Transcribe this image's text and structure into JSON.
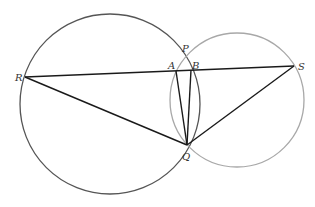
{
  "diagram": {
    "points": {
      "R": {
        "label": "R"
      },
      "P": {
        "label": "P"
      },
      "A": {
        "label": "A"
      },
      "B": {
        "label": "B"
      },
      "S": {
        "label": "S"
      },
      "Q": {
        "label": "Q"
      }
    },
    "circles": [
      {
        "name": "large-circle",
        "passes_through": [
          "R",
          "P",
          "B",
          "Q"
        ],
        "color": "#555555"
      },
      {
        "name": "small-circle",
        "passes_through": [
          "P",
          "A",
          "S",
          "Q"
        ],
        "color": "#a8a8a8"
      }
    ],
    "segments": [
      {
        "name": "segment-RS",
        "from": "R",
        "to": "S"
      },
      {
        "name": "segment-RQ",
        "from": "R",
        "to": "Q"
      },
      {
        "name": "segment-SQ",
        "from": "S",
        "to": "Q"
      },
      {
        "name": "segment-AQ",
        "from": "A",
        "to": "Q"
      },
      {
        "name": "segment-BQ",
        "from": "B",
        "to": "Q"
      }
    ],
    "line_color": "#1a1a1a"
  }
}
